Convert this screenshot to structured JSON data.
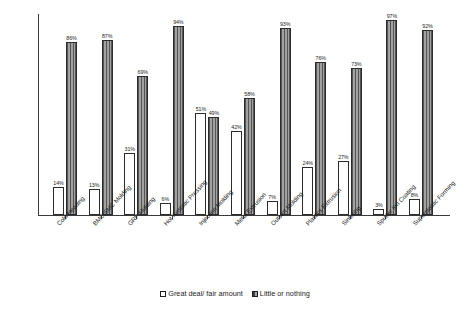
{
  "chart_data": {
    "type": "bar",
    "title": "",
    "subtitle": "",
    "xlabel": "",
    "ylabel": "",
    "ylim": [
      0,
      100
    ],
    "grid": false,
    "legend_position": "bottom-center",
    "categories": [
      "Cold Heading",
      "BMC/SMC Molding",
      "GRP Molding",
      "Hot Isostatic Pressing",
      "Injection Molding",
      "Metal Extrusion",
      "Outsert Molding",
      "Plastics Extrusion",
      "Sintering",
      "Sputter Ion Coating",
      "Superplastic Forming"
    ],
    "series": [
      {
        "name": "Great deal/ fair amount",
        "style": "white",
        "values": [
          14,
          13,
          31,
          6,
          51,
          42,
          7,
          24,
          27,
          3,
          8
        ],
        "labels": [
          "14%",
          "13%",
          "31%",
          "6%",
          "51%",
          "42%",
          "7%",
          "24%",
          "27%",
          "3%",
          "8%"
        ]
      },
      {
        "name": "Little or nothing",
        "style": "hatched-dark",
        "values": [
          86,
          87,
          69,
          94,
          49,
          58,
          93,
          76,
          73,
          97,
          92
        ],
        "labels": [
          "86%",
          "87%",
          "69%",
          "94%",
          "49%",
          "58%",
          "93%",
          "76%",
          "73%",
          "97%",
          "92%"
        ]
      }
    ]
  },
  "legend": {
    "items": [
      {
        "label": "Great deal/ fair amount",
        "swatch": "white-square-icon"
      },
      {
        "label": "Little or nothing",
        "swatch": "hatched-square-icon"
      }
    ]
  },
  "colors": {
    "bar_dark": "#8d8d8d",
    "bar_white": "#ffffff",
    "outline": "#2b2b2b",
    "axis": "#3a3a3a",
    "text": "#1d1d1d"
  }
}
